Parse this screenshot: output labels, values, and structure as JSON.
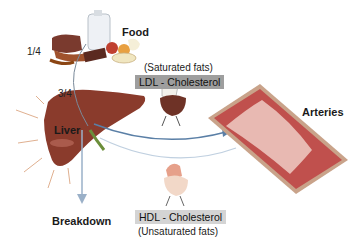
{
  "diagram": {
    "labels": {
      "food": "Food",
      "liver": "Liver",
      "arteries": "Arteries",
      "breakdown": "Breakdown",
      "fraction_food": "1/4",
      "fraction_liver": "3/4"
    },
    "ldl": {
      "note": "(Saturated fats)",
      "label": "LDL - Cholesterol",
      "box_color": "#9e9e9e"
    },
    "hdl": {
      "label": "HDL - Cholesterol",
      "note": "(Unsaturated fats)",
      "box_color": "#d4d4d4"
    },
    "colors": {
      "liver": "#8a3b2c",
      "artery_wall": "#c9a38a",
      "artery_lumen": "#e8b9b2",
      "artery_plaque": "#c0504d",
      "arrow": "#5a7fa6"
    }
  }
}
